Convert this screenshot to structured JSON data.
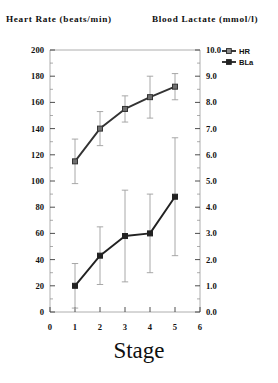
{
  "headers": {
    "left": "Heart Rate (beats/min)",
    "right": "Blood Lactate (mmol/l)"
  },
  "xlabel": "Stage",
  "legend": {
    "items": [
      {
        "label": "HR",
        "marker": "open-square"
      },
      {
        "label": "BLa",
        "marker": "filled-square"
      }
    ]
  },
  "axes": {
    "left_ticks": [
      "200",
      "180",
      "160",
      "140",
      "120",
      "100",
      "80",
      "60",
      "40",
      "20",
      "0"
    ],
    "right_ticks": [
      "10.0",
      "9.0",
      "8.0",
      "7.0",
      "6.0",
      "5.0",
      "4.0",
      "3.0",
      "2.0",
      "1.0",
      "0.0"
    ],
    "x_ticks": [
      "0",
      "1",
      "2",
      "3",
      "4",
      "5",
      "6"
    ]
  },
  "chart_data": {
    "type": "line",
    "title": "",
    "xlabel": "Stage",
    "ylabel": "Heart Rate (beats/min)",
    "y2label": "Blood Lactate (mmol/l)",
    "x": [
      1,
      2,
      3,
      4,
      5
    ],
    "xlim": [
      0,
      6
    ],
    "ylim": [
      0,
      200
    ],
    "y2lim": [
      0,
      10
    ],
    "grid": false,
    "legend_position": "top-right",
    "series": [
      {
        "name": "HR",
        "axis": "left",
        "marker": "open-square",
        "color": "#333333",
        "values": [
          115,
          140,
          155,
          164,
          172
        ],
        "errors": [
          17,
          13,
          10,
          16,
          10
        ]
      },
      {
        "name": "BLa",
        "axis": "right",
        "marker": "filled-square",
        "color": "#222222",
        "values": [
          1.0,
          2.15,
          2.9,
          3.0,
          4.4
        ],
        "errors": [
          0.85,
          1.1,
          1.75,
          1.5,
          2.25
        ]
      }
    ]
  }
}
